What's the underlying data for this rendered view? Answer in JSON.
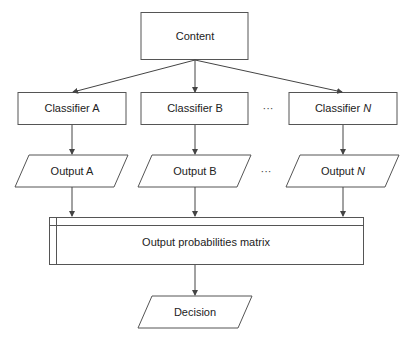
{
  "diagram": {
    "content": {
      "label": "Content"
    },
    "classifiers": [
      {
        "prefix": "Classifier ",
        "suffix": "A",
        "italic": false
      },
      {
        "prefix": "Classifier ",
        "suffix": "B",
        "italic": false
      },
      {
        "prefix": "Classifier ",
        "suffix": "N",
        "italic": true
      }
    ],
    "outputs": [
      {
        "prefix": "Output ",
        "suffix": "A",
        "italic": false
      },
      {
        "prefix": "Output ",
        "suffix": "B",
        "italic": false
      },
      {
        "prefix": "Output ",
        "suffix": "N",
        "italic": true
      }
    ],
    "ellipsis": "···",
    "matrix": {
      "label": "Output probabilities matrix"
    },
    "decision": {
      "label": "Decision"
    },
    "colors": {
      "stroke": "#555555",
      "text": "#222222",
      "background": "#ffffff"
    }
  }
}
